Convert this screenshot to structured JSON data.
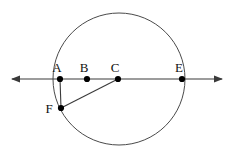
{
  "figure": {
    "type": "geometry-diagram",
    "canvas": {
      "width": 231,
      "height": 150
    },
    "stroke_color": "#3a3a3a",
    "point_color": "#000000",
    "label_color": "#111111",
    "background": "#ffffff"
  },
  "circle": {
    "name": "main-circle",
    "center_x": 119,
    "center_y": 79,
    "radius": 66,
    "stroke": "#4a4a4a",
    "stroke_width": 1,
    "fill": "none"
  },
  "line": {
    "name": "horizontal-double-arrow-line",
    "x1": 12,
    "y1": 79,
    "x2": 222,
    "y2": 79,
    "arrow_left": true,
    "arrow_right": true,
    "stroke": "#3a3a3a",
    "stroke_width": 1.2
  },
  "points": [
    {
      "id": "A",
      "label": "A",
      "x": 60,
      "y": 79,
      "label_x": 57,
      "label_y": 72,
      "radius": 3.1
    },
    {
      "id": "B",
      "label": "B",
      "x": 87,
      "y": 79,
      "label_x": 84,
      "label_y": 72,
      "radius": 3.1
    },
    {
      "id": "C",
      "label": "C",
      "x": 118,
      "y": 79,
      "label_x": 115,
      "label_y": 72,
      "radius": 3.1
    },
    {
      "id": "E",
      "label": "E",
      "x": 182,
      "y": 79,
      "label_x": 179,
      "label_y": 72,
      "radius": 3.1
    },
    {
      "id": "F",
      "label": "F",
      "x": 61,
      "y": 108,
      "label_x": 49,
      "label_y": 113,
      "radius": 3.1
    }
  ],
  "segments": [
    {
      "name": "segment-A-F",
      "from": "A",
      "to": "F",
      "x1": 60,
      "y1": 79,
      "x2": 61,
      "y2": 108,
      "stroke": "#3a3a3a",
      "stroke_width": 1.1
    },
    {
      "name": "segment-F-C",
      "from": "F",
      "to": "C",
      "x1": 61,
      "y1": 108,
      "x2": 118,
      "y2": 79,
      "stroke": "#3a3a3a",
      "stroke_width": 1.1
    }
  ],
  "labels_order": [
    "A",
    "B",
    "C",
    "E",
    "F"
  ]
}
